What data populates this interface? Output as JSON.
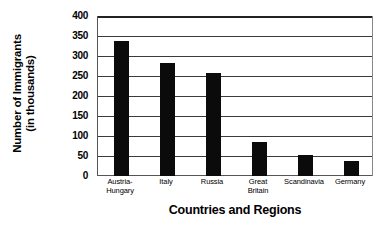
{
  "chart_data": {
    "type": "bar",
    "title": "",
    "xlabel": "Countries and Regions",
    "ylabel_line1": "Number of Immigrants",
    "ylabel_line2": "(in thousands)",
    "ylabel": "Number of Immigrants (in thousands)",
    "categories": [
      "Austria-\nHungary",
      "Italy",
      "Russia",
      "Great\nBritain",
      "Scandinavia",
      "Germany"
    ],
    "values": [
      338,
      282,
      258,
      85,
      53,
      38
    ],
    "ylim": [
      0,
      400
    ],
    "ytick_labels": [
      "400",
      "350",
      "300",
      "250",
      "200",
      "150",
      "100",
      "50",
      "0"
    ],
    "ytick_values": [
      400,
      350,
      300,
      250,
      200,
      150,
      100,
      50,
      0
    ],
    "ytick_step": 50,
    "grid": true,
    "grid_axis": "y",
    "legend": false,
    "legend_position": "none",
    "bar_color": "#0b0b0b",
    "grid_color": "#3a3a3a",
    "background_color": "#ffffff"
  }
}
